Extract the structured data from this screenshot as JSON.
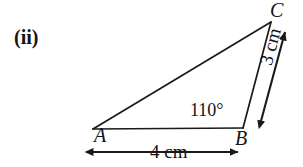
{
  "figure": {
    "part_label": "(ii)",
    "type": "triangle-geometry-diagram",
    "stroke_color": "#1a1a1a",
    "background_color": "#ffffff",
    "vertices": [
      {
        "name": "A",
        "label": "A",
        "x": 93,
        "y": 129
      },
      {
        "name": "B",
        "label": "B",
        "x": 243,
        "y": 128
      },
      {
        "name": "C",
        "label": "C",
        "x": 271,
        "y": 22
      }
    ],
    "angles": [
      {
        "at_vertex": "B",
        "label": "110°",
        "value": 110,
        "unit": "degrees"
      }
    ],
    "sides": [
      {
        "from": "A",
        "to": "B",
        "label": "4 cm",
        "value": 4,
        "unit": "cm",
        "dimension_style": "double-arrow-below"
      },
      {
        "from": "B",
        "to": "C",
        "label": "3 cm",
        "value": 3,
        "unit": "cm",
        "dimension_style": "double-arrow-parallel-right"
      }
    ],
    "icons": {
      "arrow_left": "arrow-left-icon",
      "arrow_right": "arrow-right-icon",
      "arrow_up": "arrow-up-icon",
      "arrow_down": "arrow-down-icon"
    }
  }
}
